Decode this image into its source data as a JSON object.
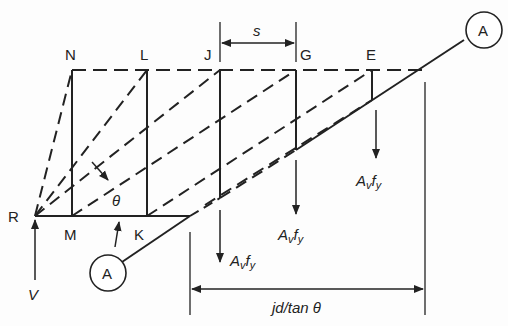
{
  "diagram": {
    "type": "truss model of beam shear (free body along inclined crack)",
    "nodes": {
      "top": [
        "N",
        "L",
        "J",
        "G",
        "E"
      ],
      "bottom": [
        "R",
        "M",
        "K"
      ]
    },
    "section_marker": "A",
    "labels": {
      "spacing": "s",
      "angle": "θ",
      "shear": "V",
      "stirrup_force": "A",
      "stirrup_force_sub_v": "v",
      "stirrup_force_f": "f",
      "stirrup_force_sub_y": "y",
      "projection": "jd/tan θ"
    },
    "colors": {
      "line": "#222222",
      "background": "#ffffff"
    }
  }
}
